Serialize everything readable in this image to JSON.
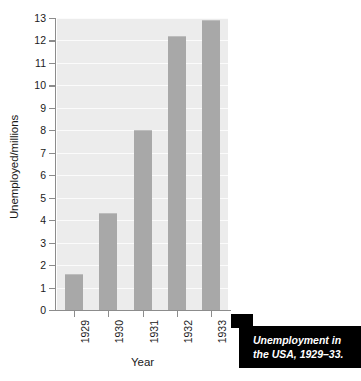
{
  "chart_data": {
    "type": "bar",
    "title": "",
    "categories": [
      "1929",
      "1930",
      "1931",
      "1932",
      "1933"
    ],
    "values": [
      1.6,
      4.3,
      8.0,
      12.2,
      12.9
    ],
    "xlabel": "Year",
    "ylabel": "Unemployed/millions",
    "ylim": [
      0,
      13
    ],
    "ytick_labels": [
      "0",
      "1",
      "2",
      "3",
      "4",
      "5",
      "6",
      "7",
      "8",
      "9",
      "10",
      "11",
      "12",
      "13"
    ],
    "ytick_values": [
      0,
      1,
      2,
      3,
      4,
      5,
      6,
      7,
      8,
      9,
      10,
      11,
      12,
      13
    ],
    "grid": true,
    "legend": "none",
    "bar_color": "#a8a8a8",
    "plot_background": "#ececec",
    "gridline_color": "#fbfbfb",
    "axis_color": "#8c8c8c"
  },
  "caption": {
    "line1": "Unemployment in",
    "line2": "the USA, 1929–33.",
    "background": "#000000",
    "text_color": "#ffffff"
  }
}
